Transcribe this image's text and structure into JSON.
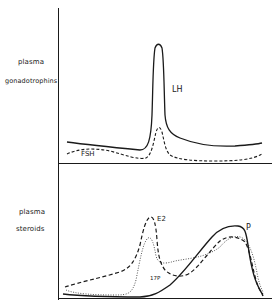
{
  "figure": {
    "panels": [
      {
        "id": "top",
        "ylabel_line1": "plasma",
        "ylabel_line2": "gonadotrophins",
        "curves": [
          {
            "name": "LH",
            "style": "solid",
            "label": "LH"
          },
          {
            "name": "FSH",
            "style": "dashed",
            "label": "FSH"
          }
        ]
      },
      {
        "id": "bottom",
        "ylabel_line1": "plasma",
        "ylabel_line2": "steroids",
        "curves": [
          {
            "name": "E2",
            "style": "dashed",
            "label": "E2"
          },
          {
            "name": "17P",
            "style": "dotted",
            "label": "17P"
          },
          {
            "name": "P",
            "style": "solid",
            "label": "P"
          }
        ]
      }
    ],
    "colors": {
      "ink": "#1a1a1a",
      "dotted": "#555555",
      "background": "#ffffff"
    }
  }
}
